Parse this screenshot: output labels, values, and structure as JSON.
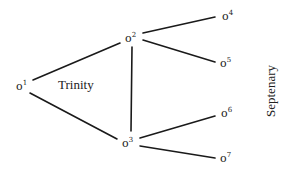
{
  "diagram": {
    "nodes": [
      {
        "id": "o1",
        "base": "o",
        "sup": "1"
      },
      {
        "id": "o2",
        "base": "o",
        "sup": "2"
      },
      {
        "id": "o3",
        "base": "o",
        "sup": "3"
      },
      {
        "id": "o4",
        "base": "o",
        "sup": "4"
      },
      {
        "id": "o5",
        "base": "o",
        "sup": "5"
      },
      {
        "id": "o6",
        "base": "o",
        "sup": "6"
      },
      {
        "id": "o7",
        "base": "o",
        "sup": "7"
      }
    ],
    "edges": [
      [
        "o1",
        "o2"
      ],
      [
        "o1",
        "o3"
      ],
      [
        "o2",
        "o3"
      ],
      [
        "o2",
        "o4"
      ],
      [
        "o2",
        "o5"
      ],
      [
        "o3",
        "o6"
      ],
      [
        "o3",
        "o7"
      ]
    ],
    "labels": {
      "trinity": "Trinity",
      "septenary": "Septenary"
    },
    "line_color": "#1a1a1a"
  }
}
